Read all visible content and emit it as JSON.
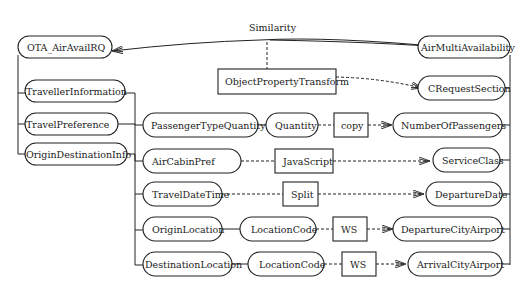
{
  "diagram": {
    "edge_label": "Similarity",
    "source_root": "OTA_AirAvailRQ",
    "target_root": "AirMultiAvailability",
    "source_nodes": {
      "traveller_information": "TravellerInformation",
      "travel_preference": "TravelPreference",
      "origin_destination_info": "OriginDestinationInfo",
      "passenger_type_quantity": "PassengerTypeQuantity",
      "quantity": "Quantity",
      "air_cabin_pref": "AirCabinPref",
      "travel_date_time": "TravelDateTime",
      "origin_location": "OriginLocation",
      "origin_location_code": "LocationCode",
      "destination_location": "DestinationLocation",
      "destination_location_code": "LocationCode"
    },
    "transforms": {
      "object_property": "ObjectPropertyTransform",
      "copy": "copy",
      "javascript": "JavaScript",
      "split": "Split",
      "ws_origin": "WS",
      "ws_destination": "WS"
    },
    "target_nodes": {
      "c_request_section": "CRequestSection",
      "number_of_passengers": "NumberOfPassengers",
      "service_class": "ServiceClass",
      "departure_date": "DepartureDate",
      "departure_city_airport": "DepartureCityAirport",
      "arrival_city_airport": "ArrivalCityAirport"
    }
  }
}
